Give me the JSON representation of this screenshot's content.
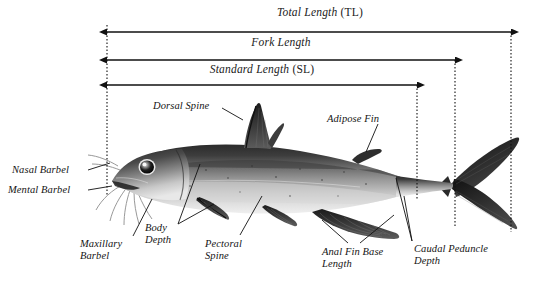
{
  "figure": {
    "background_color": "#ffffff",
    "line_color": "#111111"
  },
  "measurements": [
    {
      "id": "total-length",
      "name": "Total Length",
      "abbr": "(TL)",
      "label_x": 320,
      "label_y": 6,
      "arrow_y": 32,
      "x_start": 107,
      "x_end": 511
    },
    {
      "id": "fork-length",
      "name": "Fork Length",
      "abbr": "",
      "label_x": 281,
      "label_y": 36,
      "arrow_y": 60,
      "x_start": 107,
      "x_end": 455
    },
    {
      "id": "standard-length",
      "name": "Standard Length",
      "abbr": "(SL)",
      "label_x": 262,
      "label_y": 63,
      "arrow_y": 85,
      "x_start": 107,
      "x_end": 417
    }
  ],
  "reference_lines": [
    {
      "id": "snout-reference-line",
      "x": 107,
      "y_top": 25,
      "y_bottom": 196
    },
    {
      "id": "standard-length-reference-line",
      "x": 417,
      "y_top": 85,
      "y_bottom": 200
    },
    {
      "id": "fork-reference-line",
      "x": 455,
      "y_top": 60,
      "y_bottom": 228
    },
    {
      "id": "total-length-reference-line",
      "x": 511,
      "y_top": 32,
      "y_bottom": 232
    }
  ],
  "part_labels": [
    {
      "id": "nasal-barbel",
      "text": "Nasal Barbel",
      "x": 12,
      "y": 164,
      "align": "left",
      "leaders": [
        [
          88,
          170,
          110,
          163
        ]
      ]
    },
    {
      "id": "mental-barbel",
      "text": "Mental Barbel",
      "x": 8,
      "y": 184,
      "align": "left",
      "leaders": [
        [
          88,
          190,
          112,
          186
        ]
      ]
    },
    {
      "id": "maxillary-barbel",
      "text": "Maxillary",
      "text2": "Barbel",
      "x": 80,
      "y": 238,
      "align": "left",
      "leaders": [
        [
          133,
          236,
          152,
          199
        ]
      ]
    },
    {
      "id": "body-depth",
      "text": "Body",
      "text2": "Depth",
      "x": 145,
      "y": 222,
      "align": "left",
      "leaders": [
        [
          178,
          224,
          214,
          204
        ],
        [
          178,
          224,
          200,
          164
        ]
      ]
    },
    {
      "id": "pectoral-spine",
      "text": "Pectoral",
      "text2": "Spine",
      "x": 205,
      "y": 238,
      "align": "left",
      "leaders": [
        [
          240,
          235,
          262,
          196
        ]
      ]
    },
    {
      "id": "dorsal-spine",
      "text": "Dorsal Spine",
      "x": 153,
      "y": 100,
      "align": "left",
      "leaders": [
        [
          222,
          108,
          243,
          120
        ]
      ]
    },
    {
      "id": "adipose-fin",
      "text": "Adipose Fin",
      "x": 327,
      "y": 113,
      "align": "left",
      "leaders": [
        [
          378,
          124,
          366,
          152
        ]
      ]
    },
    {
      "id": "anal-fin-base-length",
      "text": "Anal Fin Base",
      "text2": "Length",
      "x": 322,
      "y": 246,
      "align": "left",
      "leaders": [
        [
          348,
          243,
          322,
          220
        ],
        [
          360,
          243,
          394,
          215
        ]
      ]
    },
    {
      "id": "caudal-peduncle-depth",
      "text": "Caudal Peduncle",
      "text2": "Depth",
      "x": 414,
      "y": 243,
      "align": "left",
      "leaders": [
        [
          412,
          241,
          396,
          178
        ],
        [
          412,
          241,
          404,
          196
        ]
      ]
    }
  ]
}
